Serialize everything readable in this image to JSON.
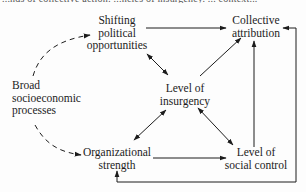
{
  "clipped_header_text": "...nds of collective action: ...ncies of insurgency. ... context...",
  "nodes": {
    "political_opportunities": {
      "lines": [
        "Shifting",
        "political",
        "opportunities"
      ]
    },
    "collective_attribution": {
      "lines": [
        "Collective",
        "attribution"
      ]
    },
    "socioeconomic_processes": {
      "lines": [
        "Broad",
        "socioeconomic",
        "processes"
      ]
    },
    "level_of_insurgency": {
      "lines": [
        "Level of",
        "insurgency"
      ]
    },
    "organizational_strength": {
      "lines": [
        "Organizational",
        "strength"
      ]
    },
    "social_control": {
      "lines": [
        "Level of",
        "social control"
      ]
    }
  },
  "edges": [
    {
      "from": "Broad socioeconomic processes",
      "to": "Shifting political opportunities",
      "style": "dashed"
    },
    {
      "from": "Broad socioeconomic processes",
      "to": "Organizational strength",
      "style": "dashed"
    },
    {
      "from": "Shifting political opportunities",
      "to": "Collective attribution",
      "style": "solid"
    },
    {
      "from": "Shifting political opportunities",
      "to": "Level of insurgency",
      "style": "solid",
      "bidirectional": true
    },
    {
      "from": "Organizational strength",
      "to": "Level of insurgency",
      "style": "solid",
      "bidirectional": true
    },
    {
      "from": "Level of insurgency",
      "to": "Collective attribution",
      "style": "solid"
    },
    {
      "from": "Level of insurgency",
      "to": "Level of social control",
      "style": "solid",
      "bidirectional": true
    },
    {
      "from": "Organizational strength",
      "to": "Level of social control",
      "style": "solid"
    },
    {
      "from": "Level of social control",
      "to": "Collective attribution",
      "style": "solid"
    },
    {
      "from": "Level of social control",
      "to": "Collective attribution",
      "style": "solid",
      "route": "right-loop"
    },
    {
      "from": "Level of social control",
      "to": "Organizational strength",
      "style": "solid",
      "route": "bottom-loop"
    }
  ],
  "colors": {
    "ink": "#1c1c1c",
    "background": "#fdfdfd"
  }
}
